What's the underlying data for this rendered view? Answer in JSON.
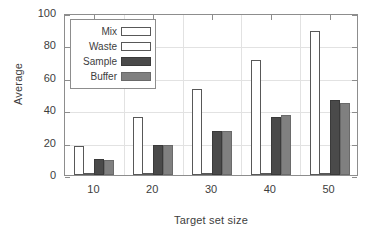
{
  "chart_data": {
    "type": "bar",
    "title": "",
    "subtitle": "",
    "xlabel": "Target set size",
    "ylabel": "Average",
    "categories": [
      "10",
      "20",
      "30",
      "40",
      "50"
    ],
    "series": [
      {
        "name": "Mix",
        "values": [
          18,
          36,
          53,
          71,
          89
        ],
        "color": "#ffffff",
        "swatch": "mix"
      },
      {
        "name": "Waste",
        "values": [
          0.5,
          0.5,
          0.5,
          0.5,
          0.5
        ],
        "color": "#ffffff",
        "swatch": "waste"
      },
      {
        "name": "Sample",
        "values": [
          10,
          18.5,
          27,
          36,
          46
        ],
        "color": "#4a4a4a",
        "swatch": "sample"
      },
      {
        "name": "Buffer",
        "values": [
          9.5,
          18.5,
          27,
          37,
          44.5
        ],
        "color": "#808080",
        "swatch": "buffer"
      }
    ],
    "ylim": [
      0,
      100
    ],
    "yticks": [
      "0",
      "20",
      "40",
      "60",
      "80",
      "100"
    ],
    "ytick_values": [
      0,
      20,
      40,
      60,
      80,
      100
    ],
    "xticks": [
      "10",
      "20",
      "30",
      "40",
      "50"
    ],
    "grid": true,
    "legend_position": "upper left"
  },
  "legend": {
    "items": [
      {
        "label": "Mix"
      },
      {
        "label": "Waste"
      },
      {
        "label": "Sample"
      },
      {
        "label": "Buffer"
      }
    ]
  },
  "axes": {
    "y_title": "Average",
    "x_title": "Target set size"
  }
}
